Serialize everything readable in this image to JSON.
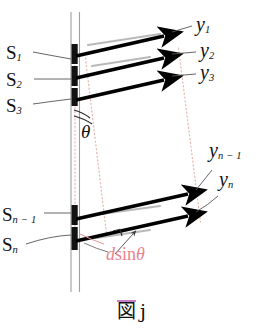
{
  "figure": {
    "caption_kanji": "図",
    "caption_label": "j",
    "caption_full": "図 j"
  },
  "colors": {
    "ink": "#111111",
    "ray": "#000000",
    "dotted_guide": "#e9b9b4",
    "annotation_red": "#e8848c",
    "barrier_gray": "#9aa0a3",
    "leader_gray": "#4a4a4a",
    "caption_rule": "#c67ec8"
  },
  "slit_labels": [
    {
      "id": "s1",
      "base": "S",
      "sub": "1",
      "text": "S₁"
    },
    {
      "id": "s2",
      "base": "S",
      "sub": "2",
      "text": "S₂"
    },
    {
      "id": "s3",
      "base": "S",
      "sub": "3",
      "text": "S₃"
    },
    {
      "id": "sn1",
      "base": "S",
      "sub": "n − 1",
      "text": "Sₙ₋₁"
    },
    {
      "id": "sn",
      "base": "S",
      "sub": "n",
      "text": "Sₙ"
    }
  ],
  "ray_labels": [
    {
      "id": "y1",
      "base": "y",
      "sub": "1",
      "text": "y₁"
    },
    {
      "id": "y2",
      "base": "y",
      "sub": "2",
      "text": "y₂"
    },
    {
      "id": "y3",
      "base": "y",
      "sub": "3",
      "text": "y₃"
    },
    {
      "id": "yn1",
      "base": "y",
      "sub": "n − 1",
      "text": "yₙ₋₁"
    },
    {
      "id": "yn",
      "base": "y",
      "sub": "n",
      "text": "yₙ"
    }
  ],
  "annotations": {
    "angle": "θ",
    "path_difference_d": "d",
    "path_difference_sin": "sin",
    "path_difference_theta": "θ",
    "path_difference_full": "d sinθ"
  }
}
